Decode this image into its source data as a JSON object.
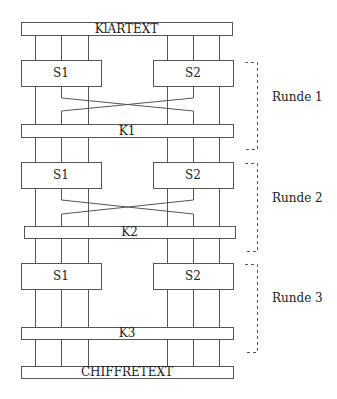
{
  "diagram": {
    "title_top": "KlARTEXT",
    "title_bottom": "CHIFFRETEXT",
    "wires_x": [
      35,
      61,
      88,
      167,
      193,
      219
    ],
    "rounds": [
      {
        "label": "Runde 1",
        "sbox_left": "S1",
        "sbox_right": "S2",
        "key": "K1",
        "sbox_y": [
          60,
          86
        ],
        "cross": true,
        "cross_y": [
          98,
          111
        ],
        "key_y": [
          124,
          137
        ],
        "key_x": [
          21,
          233
        ],
        "bracket_y": [
          62,
          149
        ],
        "label_y": 97
      },
      {
        "label": "Runde 2",
        "sbox_left": "S1",
        "sbox_right": "S2",
        "key": "K2",
        "sbox_y": [
          162,
          188
        ],
        "cross": true,
        "cross_y": [
          200,
          214
        ],
        "key_y": [
          226,
          238
        ],
        "key_x": [
          24,
          235
        ],
        "bracket_y": [
          163,
          251
        ],
        "label_y": 198
      },
      {
        "label": "Runde 3",
        "sbox_left": "S1",
        "sbox_right": "S2",
        "key": "K3",
        "sbox_y": [
          263,
          289
        ],
        "cross": false,
        "cross_y": [
          0,
          0
        ],
        "key_y": [
          327,
          339
        ],
        "key_x": [
          21,
          233
        ],
        "bracket_y": [
          264,
          352
        ],
        "label_y": 298
      }
    ],
    "plaintext_box": {
      "x": [
        21,
        232
      ],
      "y": [
        22,
        35
      ]
    },
    "ciphertext_box": {
      "x": [
        21,
        233
      ],
      "y": [
        366,
        378
      ]
    },
    "sbox_left_x": [
      21,
      101
    ],
    "sbox_right_x": [
      153,
      233
    ],
    "bracket_x": 257,
    "bracket_tick_x": 245,
    "round_label_x": 272,
    "colors": {
      "line": "#555555",
      "text": "#222222",
      "background": "#ffffff"
    }
  }
}
